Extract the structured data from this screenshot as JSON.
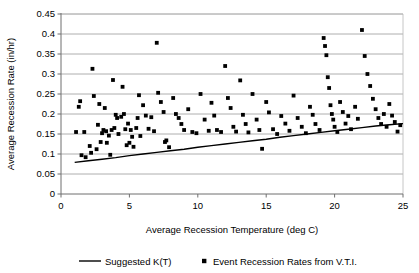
{
  "chart_data": {
    "type": "scatter",
    "title": "",
    "xlabel": "Average Recession Temperature (deg C)",
    "ylabel": "Average Recession Rate (in/hr)",
    "xlim": [
      0,
      25
    ],
    "ylim": [
      0,
      0.45
    ],
    "xticks": [
      0,
      5,
      10,
      15,
      20,
      25
    ],
    "xtick_labels": [
      "0",
      "5",
      "10",
      "15",
      "20",
      "25"
    ],
    "yticks": [
      0,
      0.05,
      0.1,
      0.15,
      0.2,
      0.25,
      0.3,
      0.35,
      0.4,
      0.45
    ],
    "ytick_labels": [
      "0",
      "0.05",
      "0.1",
      "0.15",
      "0.2",
      "0.25",
      "0.3",
      "0.35",
      "0.4",
      "0.45"
    ],
    "grid": true,
    "grid_axis": "y",
    "legend_position": "bottom",
    "legend": [
      {
        "name": "Suggested K(T)",
        "marker": "line",
        "color": "#000000"
      },
      {
        "name": "Event Recession Rates from V.T.I.",
        "marker": "square",
        "color": "#000000"
      }
    ],
    "series": [
      {
        "name": "Suggested K(T)",
        "type": "line",
        "color": "#000000",
        "points": [
          [
            1.0,
            0.079
          ],
          [
            2.0,
            0.083
          ],
          [
            3.0,
            0.087
          ],
          [
            4.0,
            0.091
          ],
          [
            5.0,
            0.096
          ],
          [
            6.0,
            0.1
          ],
          [
            7.0,
            0.104
          ],
          [
            8.0,
            0.108
          ],
          [
            9.0,
            0.112
          ],
          [
            10.0,
            0.117
          ],
          [
            11.0,
            0.121
          ],
          [
            12.0,
            0.125
          ],
          [
            13.0,
            0.129
          ],
          [
            14.0,
            0.133
          ],
          [
            15.0,
            0.137
          ],
          [
            16.0,
            0.142
          ],
          [
            17.0,
            0.146
          ],
          [
            18.0,
            0.15
          ],
          [
            19.0,
            0.154
          ],
          [
            20.0,
            0.158
          ],
          [
            21.0,
            0.162
          ],
          [
            22.0,
            0.166
          ],
          [
            23.0,
            0.17
          ],
          [
            24.0,
            0.173
          ],
          [
            25.0,
            0.176
          ]
        ]
      },
      {
        "name": "Event Recession Rates from V.T.I.",
        "type": "scatter",
        "marker": "square",
        "color": "#000000",
        "points": [
          [
            1.1,
            0.155
          ],
          [
            1.3,
            0.218
          ],
          [
            1.4,
            0.232
          ],
          [
            1.5,
            0.097
          ],
          [
            1.7,
            0.155
          ],
          [
            1.8,
            0.092
          ],
          [
            2.1,
            0.12
          ],
          [
            2.2,
            0.103
          ],
          [
            2.3,
            0.313
          ],
          [
            2.4,
            0.245
          ],
          [
            2.6,
            0.112
          ],
          [
            2.7,
            0.173
          ],
          [
            2.8,
            0.225
          ],
          [
            2.9,
            0.13
          ],
          [
            3.0,
            0.152
          ],
          [
            3.1,
            0.16
          ],
          [
            3.2,
            0.215
          ],
          [
            3.3,
            0.157
          ],
          [
            3.35,
            0.128
          ],
          [
            3.5,
            0.146
          ],
          [
            3.6,
            0.098
          ],
          [
            3.7,
            0.16
          ],
          [
            3.8,
            0.285
          ],
          [
            3.9,
            0.165
          ],
          [
            4.0,
            0.198
          ],
          [
            4.1,
            0.19
          ],
          [
            4.2,
            0.15
          ],
          [
            4.4,
            0.193
          ],
          [
            4.5,
            0.268
          ],
          [
            4.6,
            0.2
          ],
          [
            4.7,
            0.162
          ],
          [
            4.8,
            0.122
          ],
          [
            4.9,
            0.176
          ],
          [
            5.0,
            0.128
          ],
          [
            5.1,
            0.16
          ],
          [
            5.2,
            0.143
          ],
          [
            5.3,
            0.118
          ],
          [
            5.5,
            0.165
          ],
          [
            5.6,
            0.19
          ],
          [
            5.7,
            0.247
          ],
          [
            5.8,
            0.145
          ],
          [
            6.0,
            0.222
          ],
          [
            6.2,
            0.196
          ],
          [
            6.4,
            0.163
          ],
          [
            6.6,
            0.192
          ],
          [
            6.8,
            0.157
          ],
          [
            7.0,
            0.378
          ],
          [
            7.1,
            0.253
          ],
          [
            7.3,
            0.23
          ],
          [
            7.5,
            0.205
          ],
          [
            7.6,
            0.13
          ],
          [
            7.7,
            0.134
          ],
          [
            7.9,
            0.117
          ],
          [
            8.2,
            0.24
          ],
          [
            8.4,
            0.2
          ],
          [
            8.6,
            0.19
          ],
          [
            8.8,
            0.175
          ],
          [
            9.0,
            0.16
          ],
          [
            9.3,
            0.212
          ],
          [
            9.6,
            0.155
          ],
          [
            9.9,
            0.152
          ],
          [
            10.2,
            0.25
          ],
          [
            10.5,
            0.186
          ],
          [
            10.8,
            0.158
          ],
          [
            11.0,
            0.228
          ],
          [
            11.2,
            0.196
          ],
          [
            11.4,
            0.16
          ],
          [
            11.7,
            0.155
          ],
          [
            12.0,
            0.32
          ],
          [
            12.2,
            0.24
          ],
          [
            12.4,
            0.215
          ],
          [
            12.6,
            0.168
          ],
          [
            12.8,
            0.156
          ],
          [
            13.1,
            0.284
          ],
          [
            13.3,
            0.198
          ],
          [
            13.5,
            0.175
          ],
          [
            13.7,
            0.154
          ],
          [
            14.0,
            0.25
          ],
          [
            14.3,
            0.186
          ],
          [
            14.5,
            0.16
          ],
          [
            14.7,
            0.113
          ],
          [
            15.0,
            0.23
          ],
          [
            15.2,
            0.204
          ],
          [
            15.5,
            0.162
          ],
          [
            15.8,
            0.15
          ],
          [
            16.1,
            0.195
          ],
          [
            16.4,
            0.176
          ],
          [
            16.7,
            0.158
          ],
          [
            17.0,
            0.246
          ],
          [
            17.3,
            0.19
          ],
          [
            17.6,
            0.168
          ],
          [
            17.9,
            0.152
          ],
          [
            18.2,
            0.218
          ],
          [
            18.4,
            0.198
          ],
          [
            18.6,
            0.175
          ],
          [
            18.9,
            0.16
          ],
          [
            19.2,
            0.39
          ],
          [
            19.3,
            0.37
          ],
          [
            19.4,
            0.347
          ],
          [
            19.5,
            0.292
          ],
          [
            19.6,
            0.265
          ],
          [
            19.7,
            0.222
          ],
          [
            19.8,
            0.2
          ],
          [
            19.9,
            0.186
          ],
          [
            20.0,
            0.168
          ],
          [
            20.2,
            0.155
          ],
          [
            20.4,
            0.23
          ],
          [
            20.6,
            0.205
          ],
          [
            20.8,
            0.176
          ],
          [
            21.0,
            0.195
          ],
          [
            21.2,
            0.162
          ],
          [
            21.5,
            0.218
          ],
          [
            21.7,
            0.188
          ],
          [
            22.0,
            0.41
          ],
          [
            22.2,
            0.345
          ],
          [
            22.4,
            0.3
          ],
          [
            22.6,
            0.27
          ],
          [
            22.8,
            0.238
          ],
          [
            23.0,
            0.212
          ],
          [
            23.2,
            0.19
          ],
          [
            23.4,
            0.175
          ],
          [
            23.6,
            0.2
          ],
          [
            23.8,
            0.168
          ],
          [
            24.0,
            0.225
          ],
          [
            24.2,
            0.196
          ],
          [
            24.4,
            0.18
          ],
          [
            24.6,
            0.156
          ],
          [
            24.8,
            0.172
          ]
        ]
      }
    ]
  }
}
